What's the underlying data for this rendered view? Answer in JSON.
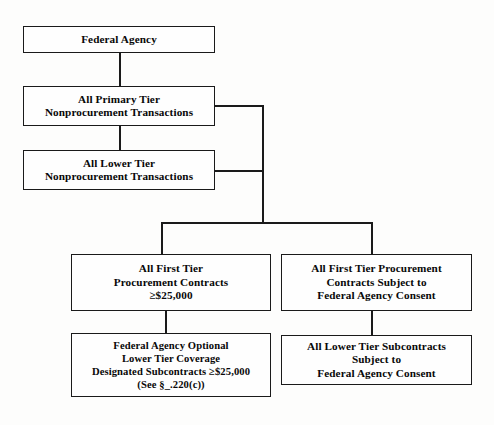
{
  "diagram": {
    "type": "flowchart",
    "colors": {
      "border": "#1a1a1a",
      "box_fill": "#fefefe",
      "background": "#fdfdfc",
      "text": "#080808"
    },
    "nodes": [
      {
        "id": "federal-agency",
        "label": "Federal Agency",
        "x": 23,
        "y": 26,
        "w": 192,
        "h": 27
      },
      {
        "id": "all-primary-tier-nonprocurement",
        "label": "All Primary Tier\nNonprocurement Transactions",
        "x": 23,
        "y": 86,
        "w": 192,
        "h": 40
      },
      {
        "id": "all-lower-tier-nonprocurement",
        "label": "All Lower Tier\nNonprocurement Transactions",
        "x": 23,
        "y": 150,
        "w": 192,
        "h": 40
      },
      {
        "id": "all-first-tier-procurement-contracts",
        "label": "All First Tier\nProcurement Contracts\n≥$25,000",
        "x": 71,
        "y": 254,
        "w": 200,
        "h": 57
      },
      {
        "id": "all-first-tier-procurement-consent",
        "label": "All First Tier Procurement\nContracts Subject to\nFederal Agency Consent",
        "x": 281,
        "y": 254,
        "w": 191,
        "h": 57
      },
      {
        "id": "federal-agency-optional-lower-tier",
        "label": "Federal Agency Optional\nLower Tier Coverage\nDesignated Subcontracts ≥$25,000\n(See §_.220(c))",
        "x": 71,
        "y": 333,
        "w": 200,
        "h": 64
      },
      {
        "id": "all-lower-tier-subcontracts-consent",
        "label": "All Lower Tier Subcontracts\nSubject to\nFederal Agency Consent",
        "x": 281,
        "y": 335,
        "w": 191,
        "h": 50
      }
    ],
    "edges": [
      {
        "id": "agency-to-primary",
        "orientation": "v",
        "x": 119,
        "y": 53,
        "len": 33
      },
      {
        "id": "primary-to-lower",
        "orientation": "v",
        "x": 119,
        "y": 126,
        "len": 24
      },
      {
        "id": "primary-stub-right",
        "orientation": "h",
        "x": 215,
        "y": 105,
        "len": 48
      },
      {
        "id": "lower-stub-right",
        "orientation": "h",
        "x": 215,
        "y": 170,
        "len": 48
      },
      {
        "id": "right-trunk-vertical",
        "orientation": "v",
        "x": 262,
        "y": 105,
        "len": 118
      },
      {
        "id": "split-bar-horizontal",
        "orientation": "h",
        "x": 161,
        "y": 222,
        "len": 211
      },
      {
        "id": "drop-to-first-tier-left",
        "orientation": "v",
        "x": 161,
        "y": 222,
        "len": 32
      },
      {
        "id": "drop-to-first-tier-right",
        "orientation": "v",
        "x": 371,
        "y": 222,
        "len": 32
      },
      {
        "id": "left-column-connector",
        "orientation": "v",
        "x": 165,
        "y": 311,
        "len": 22
      },
      {
        "id": "right-column-connector",
        "orientation": "v",
        "x": 371,
        "y": 311,
        "len": 24
      }
    ]
  }
}
